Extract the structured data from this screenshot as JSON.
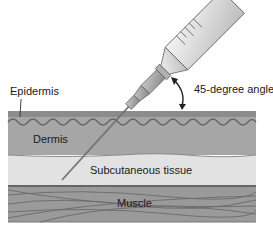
{
  "diagram": {
    "labels": {
      "epidermis": "Epidermis",
      "dermis": "Dermis",
      "subcutaneous": "Subcutaneous tissue",
      "muscle": "Muscle",
      "angle": "45-degree angle"
    },
    "colors": {
      "epidermis": "#8a8a8a",
      "dermis": "#a8a8a8",
      "subcutaneous": "#e2e2e2",
      "muscle": "#9a9a9a",
      "line": "#555555",
      "syringe_body": "#e8e8e8",
      "needle": "#6a6a6a"
    }
  }
}
